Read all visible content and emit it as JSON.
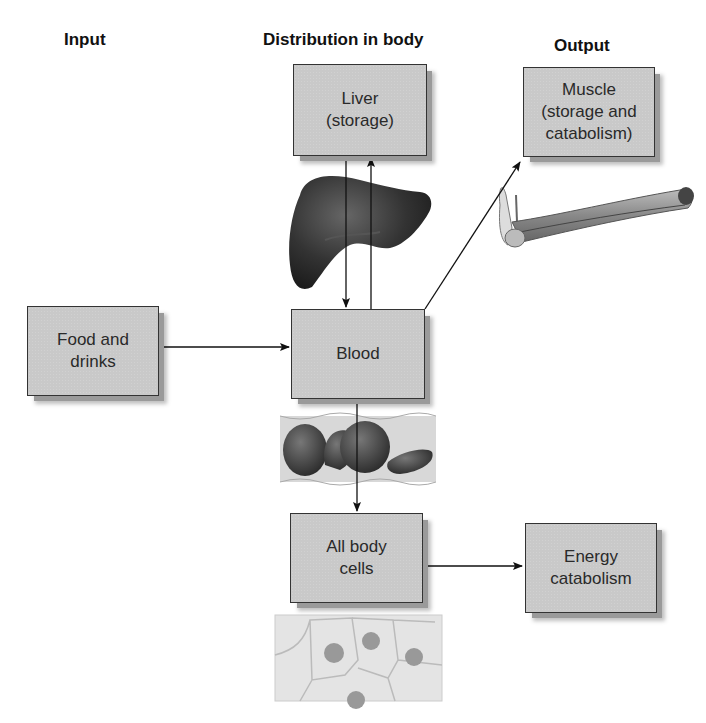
{
  "headings": {
    "input": "Input",
    "distribution": "Distribution in body",
    "output": "Output"
  },
  "boxes": {
    "liver": "Liver\n(storage)",
    "muscle": "Muscle\n(storage and\ncatabolism)",
    "food": "Food and\ndrinks",
    "blood": "Blood",
    "cells": "All body\ncells",
    "energy": "Energy\ncatabolism"
  },
  "illustrations": {
    "liver": "liver-illustration",
    "muscle": "arm-muscle-illustration",
    "blood": "red-blood-cells-illustration",
    "cells": "body-cells-illustration"
  },
  "arrows": [
    {
      "from": "food",
      "to": "blood"
    },
    {
      "from": "liver",
      "to": "blood"
    },
    {
      "from": "blood",
      "to": "liver"
    },
    {
      "from": "blood",
      "to": "muscle"
    },
    {
      "from": "blood",
      "to": "cells"
    },
    {
      "from": "cells",
      "to": "energy"
    }
  ]
}
